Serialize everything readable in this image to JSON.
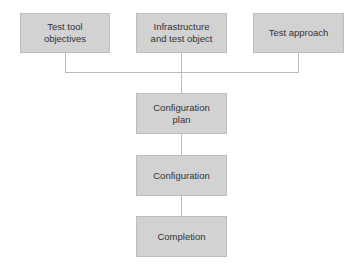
{
  "diagram": {
    "type": "flowchart",
    "colors": {
      "box_fill": "#d2d2d2",
      "box_border": "#bdbdbd",
      "connector": "#bcbcbc",
      "text": "#333333"
    },
    "inputs": [
      {
        "id": "test-tool-objectives",
        "label_line1": "Test tool",
        "label_line2": "objectives"
      },
      {
        "id": "infrastructure-and-test-object",
        "label_line1": "Infrastructure",
        "label_line2": "and test object"
      },
      {
        "id": "test-approach",
        "label_line1": "Test approach",
        "label_line2": ""
      }
    ],
    "steps": [
      {
        "id": "configuration-plan",
        "label_line1": "Configuration",
        "label_line2": "plan"
      },
      {
        "id": "configuration",
        "label_line1": "Configuration",
        "label_line2": ""
      },
      {
        "id": "completion",
        "label_line1": "Completion",
        "label_line2": ""
      }
    ],
    "edges": [
      [
        "test-tool-objectives",
        "configuration-plan"
      ],
      [
        "infrastructure-and-test-object",
        "configuration-plan"
      ],
      [
        "test-approach",
        "configuration-plan"
      ],
      [
        "configuration-plan",
        "configuration"
      ],
      [
        "configuration",
        "completion"
      ]
    ]
  }
}
